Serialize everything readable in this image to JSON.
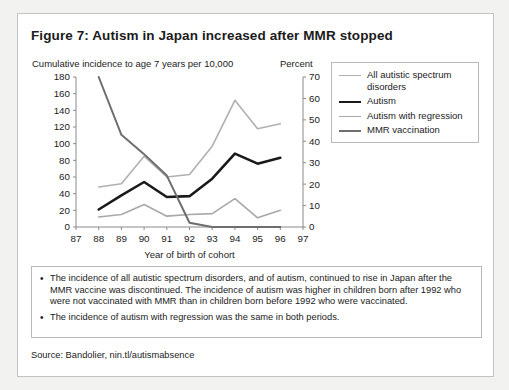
{
  "figure": {
    "title": "Figure 7: Autism in Japan increased after MMR stopped",
    "left_axis_caption": "Cumulative incidence to age 7 years per 10,000",
    "right_axis_caption": "Percent",
    "source": "Source: Bandolier, nin.tl/autismabsence"
  },
  "notes": [
    {
      "bullet": "•",
      "text": "The incidence of all autistic spectrum disorders, and of autism, continued to rise in Japan after the MMR vaccine was discontinued. The incidence of autism was higher in children born after 1992 who were not vaccinated with MMR than in children born before 1992 who were vaccinated."
    },
    {
      "bullet": "•",
      "text": "The incidence of autism with regression was the same in both periods."
    }
  ],
  "legend": {
    "items": [
      {
        "label": "All autistic spectrum disorders",
        "color": "#b0b0b0",
        "width": 1.6
      },
      {
        "label": "Autism",
        "color": "#1a1a1a",
        "width": 2.6
      },
      {
        "label": "Autism with regression",
        "color": "#a8a8a8",
        "width": 1.6
      },
      {
        "label": "MMR vaccination",
        "color": "#6e6e6e",
        "width": 2.0
      }
    ]
  },
  "chart_data": {
    "type": "line",
    "title": "Figure 7: Autism in Japan increased after MMR stopped",
    "xlabel": "Year of birth of cohort",
    "ylabel": "Cumulative incidence to age 7 years per 10,000",
    "ylabel_right": "Percent",
    "grid": false,
    "legend_position": "right",
    "x": [
      88,
      89,
      90,
      91,
      92,
      93,
      94,
      95,
      96
    ],
    "xlim": [
      87,
      97
    ],
    "xticks": [
      87,
      88,
      89,
      90,
      91,
      92,
      93,
      94,
      95,
      96,
      97
    ],
    "ylim": [
      0,
      180
    ],
    "yticks": [
      0,
      20,
      40,
      60,
      80,
      100,
      120,
      140,
      160,
      180
    ],
    "ylim_right": [
      0,
      70
    ],
    "yticks_right": [
      0,
      10,
      20,
      30,
      40,
      50,
      60,
      70
    ],
    "series": [
      {
        "name": "All autistic spectrum disorders",
        "axis": "left",
        "color": "#b0b0b0",
        "width": 1.6,
        "values": [
          48,
          52,
          85,
          60,
          63,
          97,
          152,
          118,
          124
        ]
      },
      {
        "name": "Autism",
        "axis": "left",
        "color": "#1a1a1a",
        "width": 2.6,
        "values": [
          21,
          38,
          54,
          36,
          37,
          58,
          88,
          76,
          83
        ]
      },
      {
        "name": "Autism with regression",
        "axis": "left",
        "color": "#a8a8a8",
        "width": 1.6,
        "values": [
          12,
          15,
          27,
          13,
          15,
          16,
          34,
          11,
          20
        ]
      },
      {
        "name": "MMR vaccination",
        "axis": "right",
        "color": "#6e6e6e",
        "width": 2.0,
        "values": [
          70,
          43,
          34,
          24,
          2,
          0,
          0,
          0,
          0
        ]
      }
    ]
  }
}
